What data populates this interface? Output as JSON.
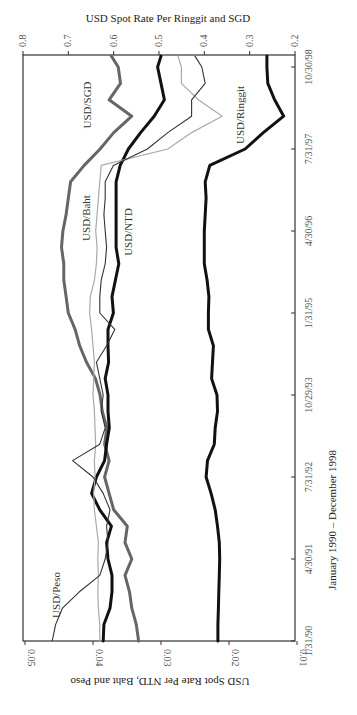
{
  "chart_data": {
    "type": "line",
    "orientation": "rotated-90",
    "title": "",
    "xlabel": "January 1990 – December 1998",
    "ylabel_left": "USD Spot Rate Per NTD, Baht and Peso",
    "ylabel_right": "USD Spot Rate Per Ringgit and SGD",
    "x_ticks": [
      "1/31/90",
      "4/30/91",
      "7/31/92",
      "10/29/93",
      "1/31/95",
      "4/30/96",
      "7/31/97",
      "10/30/98"
    ],
    "y_left_ticks": [
      "0.05",
      "0.04",
      "0.03",
      "0.02",
      "0.01"
    ],
    "y_left_range": [
      0.01,
      0.05
    ],
    "y_right_ticks": [
      "0.8",
      "0.7",
      "0.6",
      "0.5",
      "0.4",
      "0.3",
      "0.2"
    ],
    "y_right_range": [
      0.2,
      0.8
    ],
    "x_months_from_jan1990": [
      0,
      3,
      6,
      9,
      12,
      15,
      18,
      21,
      24,
      27,
      30,
      33,
      36,
      39,
      42,
      45,
      48,
      51,
      54,
      57,
      60,
      63,
      66,
      69,
      72,
      75,
      78,
      81,
      84,
      87,
      90,
      93,
      96,
      99,
      102,
      105,
      107
    ],
    "series": [
      {
        "name": "USD/Ringgit",
        "axis": "right",
        "style": "thick-black",
        "values": [
          0.37,
          0.37,
          0.369,
          0.368,
          0.367,
          0.366,
          0.367,
          0.371,
          0.376,
          0.385,
          0.396,
          0.393,
          0.378,
          0.376,
          0.371,
          0.372,
          0.384,
          0.382,
          0.38,
          0.391,
          0.391,
          0.39,
          0.394,
          0.4,
          0.4,
          0.4,
          0.398,
          0.396,
          0.398,
          0.388,
          0.31,
          0.27,
          0.225,
          0.245,
          0.26,
          0.262,
          0.262
        ]
      },
      {
        "name": "USD/SGD",
        "axis": "right",
        "style": "thick-gray",
        "values": [
          0.545,
          0.55,
          0.56,
          0.565,
          0.575,
          0.56,
          0.575,
          0.57,
          0.6,
          0.61,
          0.62,
          0.61,
          0.62,
          0.615,
          0.625,
          0.63,
          0.64,
          0.66,
          0.675,
          0.685,
          0.7,
          0.705,
          0.71,
          0.71,
          0.715,
          0.712,
          0.705,
          0.7,
          0.695,
          0.665,
          0.63,
          0.6,
          0.56,
          0.61,
          0.585,
          0.59,
          0.605
        ]
      },
      {
        "name": "USD/NTD",
        "axis": "left",
        "style": "thick-black",
        "values": [
          0.0385,
          0.0384,
          0.0375,
          0.0372,
          0.0372,
          0.0378,
          0.038,
          0.0373,
          0.039,
          0.0402,
          0.0395,
          0.0383,
          0.038,
          0.0376,
          0.0378,
          0.0378,
          0.0382,
          0.0377,
          0.0378,
          0.0378,
          0.037,
          0.0372,
          0.0367,
          0.0362,
          0.0366,
          0.0366,
          0.0366,
          0.0366,
          0.0366,
          0.036,
          0.0348,
          0.033,
          0.031,
          0.0295,
          0.03,
          0.0305,
          0.03
        ]
      },
      {
        "name": "USD/Baht",
        "axis": "left",
        "style": "thin-light-gray",
        "values": [
          0.039,
          0.039,
          0.0392,
          0.0393,
          0.0392,
          0.0393,
          0.0392,
          0.0395,
          0.0398,
          0.0399,
          0.0397,
          0.0398,
          0.0396,
          0.0397,
          0.0398,
          0.04,
          0.0399,
          0.0398,
          0.04,
          0.0402,
          0.0405,
          0.0404,
          0.0398,
          0.0395,
          0.0394,
          0.0396,
          0.0394,
          0.0392,
          0.039,
          0.0388,
          0.029,
          0.0255,
          0.021,
          0.0245,
          0.027,
          0.027,
          0.0275
        ]
      },
      {
        "name": "USD/Peso",
        "axis": "left",
        "style": "thin-dark",
        "values": [
          0.046,
          0.0455,
          0.0445,
          0.042,
          0.039,
          0.0382,
          0.0378,
          0.038,
          0.0375,
          0.0385,
          0.04,
          0.043,
          0.039,
          0.0382,
          0.0388,
          0.0385,
          0.039,
          0.0395,
          0.038,
          0.0368,
          0.039,
          0.039,
          0.0388,
          0.0382,
          0.038,
          0.0382,
          0.0384,
          0.0382,
          0.0382,
          0.037,
          0.032,
          0.029,
          0.0255,
          0.0255,
          0.0235,
          0.024,
          0.025
        ]
      }
    ],
    "series_labels": [
      {
        "name": "USD/SGD",
        "text": "USD/SGD"
      },
      {
        "name": "USD/Baht",
        "text": "USD/Baht"
      },
      {
        "name": "USD/NTD",
        "text": "USD/NTD"
      },
      {
        "name": "USD/Ringgit",
        "text": "USD/Ringgit"
      },
      {
        "name": "USD/Peso",
        "text": "USD/Peso"
      }
    ],
    "grid": false,
    "legend": "inline labels"
  },
  "labels": {
    "right_axis_title": "USD Spot Rate Per Ringgit and SGD",
    "left_axis_title": "USD Spot Rate Per NTD, Baht and Peso",
    "x_axis_title": "January 1990 – December 1998",
    "right_ticks": [
      "0.8",
      "0.7",
      "0.6",
      "0.5",
      "0.4",
      "0.3",
      "0.2"
    ],
    "left_ticks": [
      "0.05",
      "0.04",
      "0.03",
      "0.02",
      "0.01"
    ],
    "date_ticks": [
      "1/31/90",
      "4/30/91",
      "7/31/92",
      "10/29/93",
      "1/31/95",
      "4/30/96",
      "7/31/97",
      "10/30/98"
    ],
    "series": {
      "sgd": "USD/SGD",
      "baht": "USD/Baht",
      "ntd": "USD/NTD",
      "ringgit": "USD/Ringgit",
      "peso": "USD/Peso"
    }
  }
}
